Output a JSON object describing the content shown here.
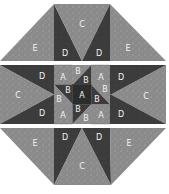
{
  "diagram": {
    "colors": {
      "light": "#8c8c8c",
      "dark": "#3c3c3c",
      "center_dark": "#2a2a2a",
      "medium": "#7a7a7a",
      "label": "#f2f2f2",
      "seam_gap": "#ffffff"
    },
    "rows": [
      {
        "name": "top-row",
        "pieces": [
          {
            "id": "E-top-left",
            "label": "E",
            "shade": "light"
          },
          {
            "id": "D-top-left",
            "label": "D",
            "shade": "dark"
          },
          {
            "id": "C-top",
            "label": "C",
            "shade": "light"
          },
          {
            "id": "D-top-right",
            "label": "D",
            "shade": "dark"
          },
          {
            "id": "E-top-right",
            "label": "E",
            "shade": "light"
          }
        ]
      },
      {
        "name": "middle-row",
        "pieces": [
          {
            "id": "C-left",
            "label": "C",
            "shade": "light"
          },
          {
            "id": "D-left-upper",
            "label": "D",
            "shade": "dark"
          },
          {
            "id": "D-left-lower",
            "label": "D",
            "shade": "dark"
          },
          {
            "id": "A-top-left",
            "label": "A",
            "shade": "light"
          },
          {
            "id": "B-top-light",
            "label": "B",
            "shade": "light"
          },
          {
            "id": "B-top-dark",
            "label": "B",
            "shade": "dark"
          },
          {
            "id": "A-top-right",
            "label": "A",
            "shade": "light"
          },
          {
            "id": "B-left-dark",
            "label": "B",
            "shade": "dark"
          },
          {
            "id": "B-left-light",
            "label": "B",
            "shade": "light"
          },
          {
            "id": "A-center",
            "label": "A",
            "shade": "dark"
          },
          {
            "id": "B-right-light",
            "label": "B",
            "shade": "light"
          },
          {
            "id": "B-right-dark",
            "label": "B",
            "shade": "dark"
          },
          {
            "id": "A-bottom-left",
            "label": "A",
            "shade": "light"
          },
          {
            "id": "B-bottom-dark",
            "label": "B",
            "shade": "dark"
          },
          {
            "id": "B-bottom-light",
            "label": "B",
            "shade": "light"
          },
          {
            "id": "A-bottom-right",
            "label": "A",
            "shade": "light"
          },
          {
            "id": "D-right-upper",
            "label": "D",
            "shade": "dark"
          },
          {
            "id": "D-right-lower",
            "label": "D",
            "shade": "dark"
          },
          {
            "id": "C-right",
            "label": "C",
            "shade": "light"
          }
        ]
      },
      {
        "name": "bottom-row",
        "pieces": [
          {
            "id": "E-bottom-left",
            "label": "E",
            "shade": "light"
          },
          {
            "id": "D-bottom-left",
            "label": "D",
            "shade": "dark"
          },
          {
            "id": "C-bottom",
            "label": "C",
            "shade": "light"
          },
          {
            "id": "D-bottom-right",
            "label": "D",
            "shade": "dark"
          },
          {
            "id": "E-bottom-right",
            "label": "E",
            "shade": "light"
          }
        ]
      }
    ]
  },
  "labels": {
    "top": {
      "e_left": "E",
      "d_left": "D",
      "c": "C",
      "d_right": "D",
      "e_right": "E"
    },
    "middle": {
      "c_left": "C",
      "d_left_upper": "D",
      "d_left_lower": "D",
      "a_tl": "A",
      "b_top_light": "B",
      "b_top_dark": "B",
      "a_tr": "A",
      "b_left_dark": "B",
      "b_left_light": "B",
      "a_center": "A",
      "b_right_light": "B",
      "b_right_dark": "B",
      "a_bl": "A",
      "b_bottom_dark": "B",
      "b_bottom_light": "B",
      "a_br": "A",
      "d_right_upper": "D",
      "d_right_lower": "D",
      "c_right": "C"
    },
    "bottom": {
      "e_left": "E",
      "d_left": "D",
      "c": "C",
      "d_right": "D",
      "e_right": "E"
    }
  }
}
